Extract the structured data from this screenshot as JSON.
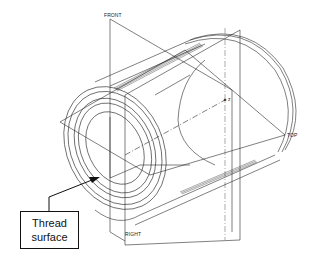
{
  "figure": {
    "type": "isometric technical drawing",
    "datum_planes": [
      {
        "name": "FRONT",
        "label": "FRONT"
      },
      {
        "name": "TOP",
        "label": "TOP"
      },
      {
        "name": "RIGHT",
        "label": "RIGHT"
      }
    ],
    "origin_marker": "z",
    "callout": {
      "line1": "Thread",
      "line2": "surface"
    }
  },
  "colors": {
    "line": "#2a2a2a",
    "background": "#ffffff",
    "callout_border": "#111111"
  }
}
